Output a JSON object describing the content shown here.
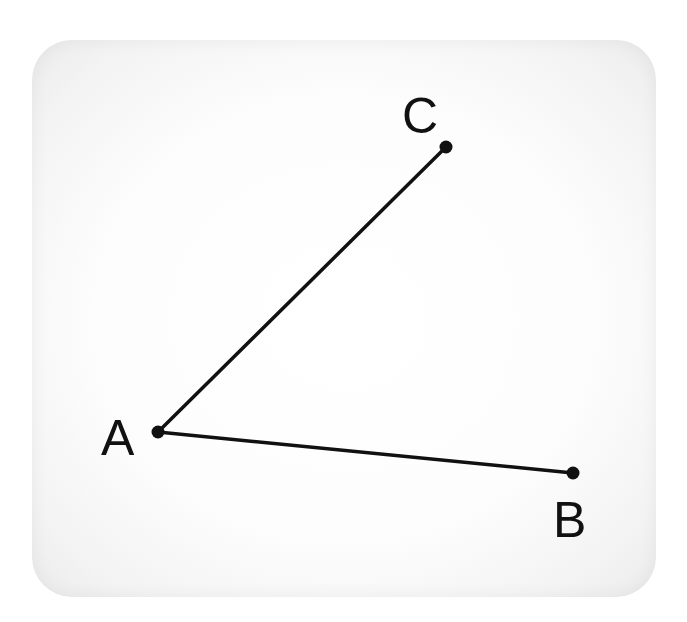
{
  "diagram": {
    "type": "angle",
    "colors": {
      "stroke": "#111111",
      "point": "#111111",
      "card_background": "#fdfdfd",
      "page_background": "#ffffff"
    },
    "points": [
      {
        "name": "A",
        "label": "A",
        "x": 158,
        "y": 432,
        "label_x": 101,
        "label_y": 455
      },
      {
        "name": "B",
        "label": "B",
        "x": 573,
        "y": 473,
        "label_x": 554,
        "label_y": 537
      },
      {
        "name": "C",
        "label": "C",
        "x": 446,
        "y": 147,
        "label_x": 403,
        "label_y": 133
      }
    ],
    "segments": [
      {
        "name": "AC",
        "from": "A",
        "to": "C"
      },
      {
        "name": "AB",
        "from": "A",
        "to": "B"
      }
    ]
  }
}
